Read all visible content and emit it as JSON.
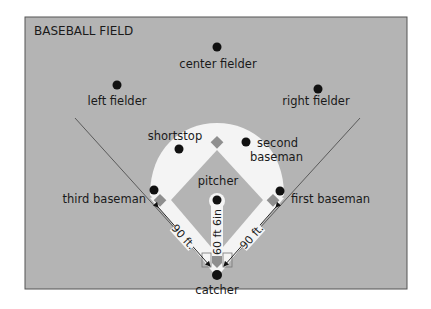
{
  "title": "BASEBALL FIELD",
  "colors": {
    "field": "#b4b4b4",
    "infield_dirt": "#f4f4f4",
    "base": "#8f8f8f",
    "player": "#111111",
    "foul_line": "#555555",
    "border": "#555555"
  },
  "players": {
    "center_fielder": "center fielder",
    "left_fielder": "left fielder",
    "right_fielder": "right fielder",
    "shortstop": "shortstop",
    "second_baseman_line1": "second",
    "second_baseman_line2": "baseman",
    "pitcher": "pitcher",
    "third_baseman": "third baseman",
    "first_baseman": "first baseman",
    "catcher": "catcher"
  },
  "measurements": {
    "home_to_third": "90 ft.",
    "home_to_first": "90 ft.",
    "pitching_distance": "60 ft 6in"
  }
}
